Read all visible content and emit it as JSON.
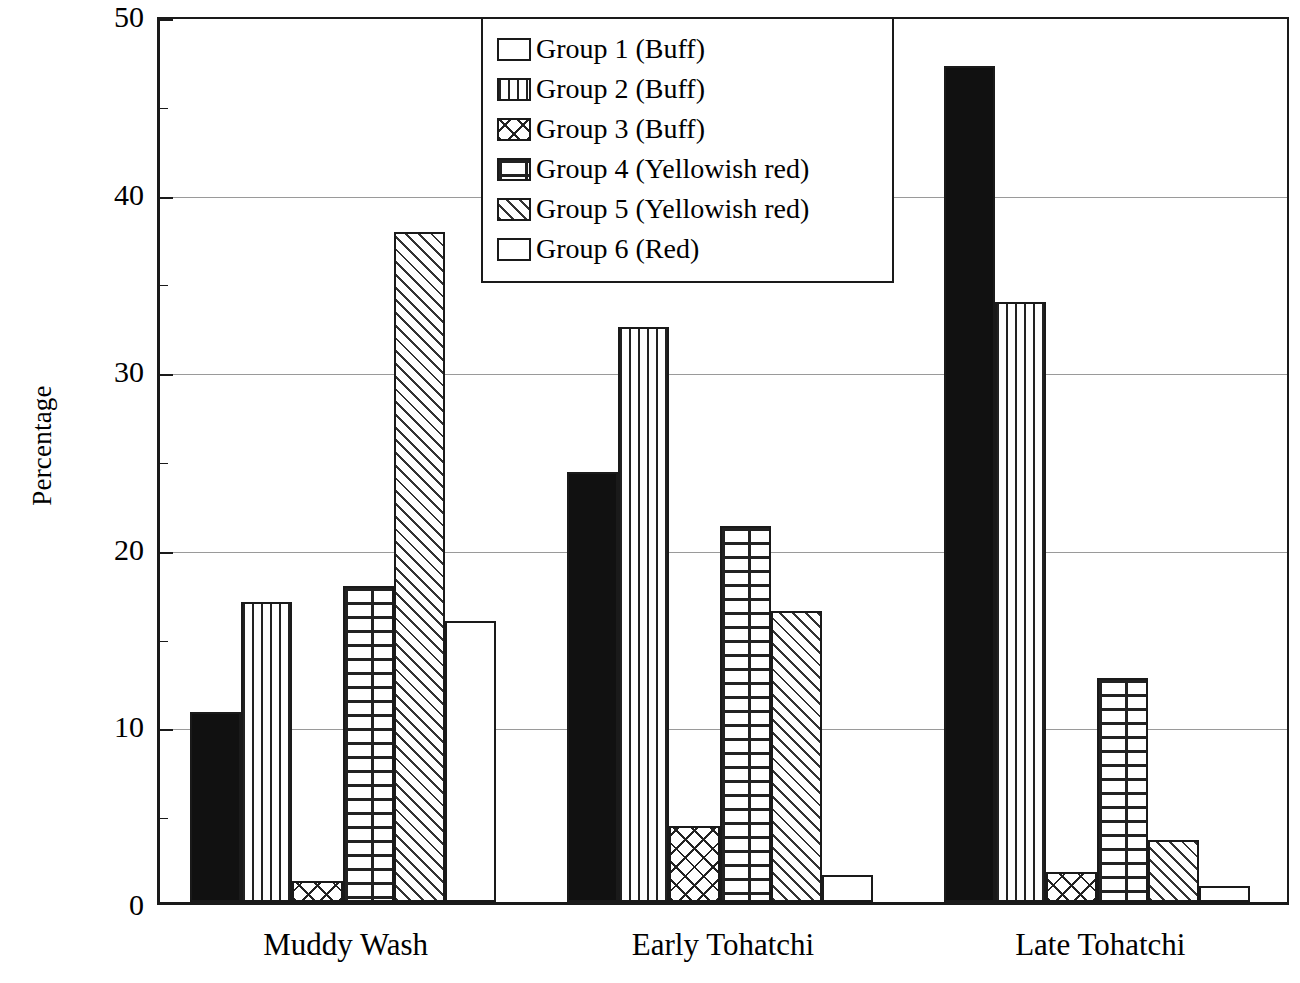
{
  "chart_data": {
    "type": "bar",
    "title": "",
    "subtitle": "",
    "xlabel": "",
    "ylabel": "Percentage",
    "ylim": [
      0,
      50
    ],
    "y_ticks": [
      0,
      10,
      20,
      30,
      40,
      50
    ],
    "y_minor_tick_step": 5,
    "grid": true,
    "grid_axis": "y",
    "legend_position": "top-center",
    "categories": [
      "Muddy Wash",
      "Early Tohatchi",
      "Late Tohatchi"
    ],
    "series": [
      {
        "name": "Group 1 (Buff)",
        "pattern": "solid-black",
        "values": [
          10.7,
          24.2,
          47.1
        ]
      },
      {
        "name": "Group 2 (Buff)",
        "pattern": "vertical-lines",
        "values": [
          16.9,
          32.4,
          33.8
        ]
      },
      {
        "name": "Group 3 (Buff)",
        "pattern": "cross-hatch",
        "values": [
          1.2,
          4.3,
          1.7
        ]
      },
      {
        "name": "Group 4 (Yellowish red)",
        "pattern": "brick",
        "values": [
          17.8,
          21.2,
          12.6
        ]
      },
      {
        "name": "Group 5 (Yellowish red)",
        "pattern": "diagonal-hatch",
        "values": [
          37.7,
          16.4,
          3.5
        ]
      },
      {
        "name": "Group 6 (Red)",
        "pattern": "blank-white",
        "values": [
          15.8,
          1.5,
          0.9
        ]
      }
    ]
  },
  "axis": {
    "y_title": "Percentage",
    "y_tick_labels": [
      "50",
      "40",
      "30",
      "20",
      "10",
      "0"
    ],
    "x_tick_labels": [
      "Muddy Wash",
      "Early Tohatchi",
      "Late Tohatchi"
    ]
  },
  "legend": {
    "entries": [
      {
        "label": "Group 1 (Buff)"
      },
      {
        "label": "Group 2 (Buff)"
      },
      {
        "label": "Group 3 (Buff)"
      },
      {
        "label": "Group 4 (Yellowish red)"
      },
      {
        "label": "Group 5 (Yellowish red)"
      },
      {
        "label": "Group 6 (Red)"
      }
    ]
  },
  "colors": {
    "axis": "#1a1a1a",
    "gridline": "#9a9a9a",
    "bar_fill": "#ffffff",
    "bar_solid": "#111111",
    "background": "#ffffff"
  }
}
